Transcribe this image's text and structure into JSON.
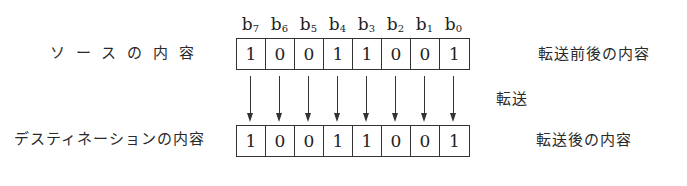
{
  "diagram": {
    "bit_labels": [
      {
        "base": "b",
        "sub": "7"
      },
      {
        "base": "b",
        "sub": "6"
      },
      {
        "base": "b",
        "sub": "5"
      },
      {
        "base": "b",
        "sub": "4"
      },
      {
        "base": "b",
        "sub": "3"
      },
      {
        "base": "b",
        "sub": "2"
      },
      {
        "base": "b",
        "sub": "1"
      },
      {
        "base": "b",
        "sub": "0"
      }
    ],
    "source": {
      "label": "ソースの内容",
      "bits": [
        "1",
        "0",
        "0",
        "1",
        "1",
        "0",
        "0",
        "1"
      ],
      "right_label": "転送前後の内容"
    },
    "transfer_label": "転送",
    "destination": {
      "label": "デスティネーションの内容",
      "bits": [
        "1",
        "0",
        "0",
        "1",
        "1",
        "0",
        "0",
        "1"
      ],
      "right_label": "転送後の内容"
    },
    "colors": {
      "line": "#333333",
      "text": "#2a2a2a",
      "background": "#ffffff"
    }
  }
}
